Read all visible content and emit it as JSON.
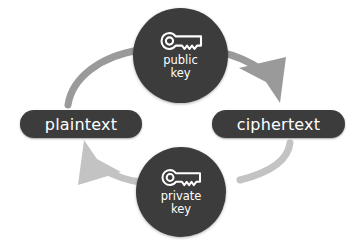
{
  "diagram": {
    "type": "cycle",
    "colors": {
      "node_fill": "#3c3c3c",
      "node_text": "#ffffff",
      "pill_fill": "#3c3c3c",
      "pill_text": "#ffffff",
      "arrow_encrypt": "#9a9a9a",
      "arrow_decrypt": "#c3c3c3",
      "background": "#ffffff"
    },
    "nodes": [
      {
        "id": "public-key",
        "shape": "circle",
        "icon": "key-icon",
        "label_line1": "public",
        "label_line2": "key"
      },
      {
        "id": "private-key",
        "shape": "circle",
        "icon": "key-icon",
        "label_line1": "private",
        "label_line2": "key"
      }
    ],
    "boxes": [
      {
        "id": "plaintext",
        "label": "plaintext"
      },
      {
        "id": "ciphertext",
        "label": "ciphertext"
      }
    ],
    "arrows": [
      {
        "id": "encrypt-arrow",
        "from": "plaintext",
        "to": "ciphertext",
        "via": "public-key",
        "direction": "left-to-right",
        "color": "#9a9a9a"
      },
      {
        "id": "decrypt-arrow",
        "from": "ciphertext",
        "to": "plaintext",
        "via": "private-key",
        "direction": "right-to-left",
        "color": "#c3c3c3"
      }
    ]
  }
}
